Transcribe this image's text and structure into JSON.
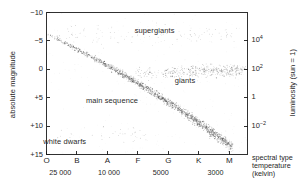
{
  "figure": {
    "kind": "hertzsprung-russell-diagram",
    "background": "#ffffff",
    "ink": "#1a1a1a",
    "star_color": "#555555"
  },
  "chart_data": {
    "type": "scatter",
    "title": "",
    "subtitle": "",
    "xlabel": "spectral type",
    "xlabel_line2": "temperature",
    "xlabel_line3": "(kelvin)",
    "ylabel": "absolute magnitude",
    "ylabel_right": "luminosity (sun = 1)",
    "grid": false,
    "legend_position": "none",
    "x_axis": {
      "name": "spectral type",
      "categories": [
        "O",
        "B",
        "A",
        "F",
        "G",
        "K",
        "M"
      ],
      "tick_positions": [
        0,
        1,
        2,
        3,
        4,
        5,
        6
      ],
      "direction": "hot-to-cool"
    },
    "temperature_axis": {
      "name": "temperature (kelvin)",
      "tick_labels": [
        "25 000",
        "10 000",
        "5000",
        "3000"
      ],
      "tick_at_spectral": [
        0.45,
        2.05,
        3.75,
        5.55
      ]
    },
    "y_axis_left": {
      "name": "absolute magnitude",
      "tick_labels": [
        "−10",
        "−5",
        "0",
        "+5",
        "+10",
        "+15"
      ],
      "tick_values": [
        -10,
        -5,
        0,
        5,
        10,
        15
      ],
      "ylim": [
        -10,
        15
      ],
      "direction": "inverted-brighter-up"
    },
    "y_axis_right": {
      "name": "luminosity (sun = 1)",
      "tick_labels": [
        "10⁴",
        "10²",
        "1",
        "10⁻²"
      ],
      "tick_mantissa": [
        "10",
        "10",
        "1",
        "10"
      ],
      "tick_exponent": [
        "4",
        "2",
        "",
        "-2"
      ],
      "tick_magnitude_equiv": [
        -5.0,
        0.0,
        5.0,
        10.0
      ]
    },
    "annotations": [
      {
        "label": "supergiants",
        "x_spectral": 3.55,
        "magnitude": -6.8
      },
      {
        "label": "giants",
        "x_spectral": 4.55,
        "magnitude": 2.1
      },
      {
        "label": "main sequence",
        "x_spectral": 2.15,
        "magnitude": 5.6
      },
      {
        "label": "white dwarfs",
        "x_spectral": 0.6,
        "magnitude": 12.8
      }
    ],
    "populations": [
      {
        "name": "main sequence",
        "count": 1500,
        "description": "dense diagonal band from upper-left (O, -6) to lower-right (M, +14)"
      },
      {
        "name": "giants",
        "count": 420,
        "description": "horizontal clump near magnitude 0 spanning G through M"
      },
      {
        "name": "supergiants",
        "count": 120,
        "description": "sparse scatter near magnitude -7 to -4 across B through M"
      },
      {
        "name": "white dwarfs",
        "count": 40,
        "description": "sparse scatter near magnitude +11 to +14 at B through F"
      }
    ]
  }
}
